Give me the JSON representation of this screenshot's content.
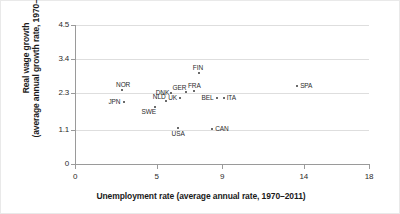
{
  "chart_data": {
    "type": "scatter",
    "title": "",
    "xlabel": "Unemployment rate (average annual rate, 1970–2011)",
    "ylabel_line1": "Real wage growth",
    "ylabel_line2": "(average annual growth rate, 1970–2011)",
    "xlim": [
      0,
      18
    ],
    "ylim": [
      0,
      4.5
    ],
    "xticks": [
      "0",
      "5",
      "9",
      "14",
      "18"
    ],
    "xtick_values": [
      0,
      5,
      9,
      14,
      18
    ],
    "yticks": [
      "0",
      "1.1",
      "2.3",
      "3.4",
      "4.5"
    ],
    "ytick_values": [
      0,
      1.1,
      2.3,
      3.4,
      4.5
    ],
    "grid": "horizontal",
    "legend": "none",
    "point_color": "#3a3a3a",
    "grid_color": "#dedede",
    "axis_color": "#9a9a9a",
    "points": [
      {
        "label": "NOR",
        "x": 2.9,
        "y": 2.38,
        "label_pos": "above"
      },
      {
        "label": "JPN",
        "x": 3.0,
        "y": 2.0,
        "label_pos": "left"
      },
      {
        "label": "SWE",
        "x": 4.9,
        "y": 1.85,
        "label_pos": "below-left"
      },
      {
        "label": "NLD",
        "x": 5.6,
        "y": 2.05,
        "label_pos": "above-left"
      },
      {
        "label": "DNK",
        "x": 5.9,
        "y": 2.3,
        "label_pos": "left"
      },
      {
        "label": "UK",
        "x": 6.4,
        "y": 2.15,
        "label_pos": "left"
      },
      {
        "label": "USA",
        "x": 6.3,
        "y": 1.15,
        "label_pos": "below"
      },
      {
        "label": "GER",
        "x": 6.8,
        "y": 2.33,
        "label_pos": "above-left"
      },
      {
        "label": "FRA",
        "x": 7.3,
        "y": 2.35,
        "label_pos": "above"
      },
      {
        "label": "FIN",
        "x": 7.6,
        "y": 2.95,
        "label_pos": "above"
      },
      {
        "label": "CAN",
        "x": 8.4,
        "y": 1.12,
        "label_pos": "right"
      },
      {
        "label": "BEL",
        "x": 8.7,
        "y": 2.13,
        "label_pos": "left"
      },
      {
        "label": "ITA",
        "x": 9.1,
        "y": 2.13,
        "label_pos": "right"
      },
      {
        "label": "SPA",
        "x": 13.6,
        "y": 2.52,
        "label_pos": "right"
      }
    ]
  }
}
